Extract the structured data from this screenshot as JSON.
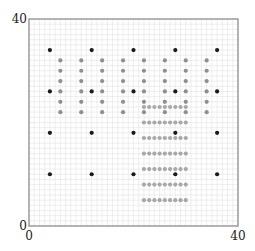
{
  "chart_data": {
    "type": "scatter",
    "title": "",
    "xlabel": "",
    "ylabel": "",
    "xlim": [
      0,
      40
    ],
    "ylim": [
      0,
      40
    ],
    "grid": true,
    "grid_step": 1,
    "ticks": {
      "x": [
        {
          "value": 0,
          "label": "0"
        },
        {
          "value": 40,
          "label": "40"
        }
      ],
      "y": [
        {
          "value": 0,
          "label": "0"
        },
        {
          "value": 40,
          "label": "40"
        }
      ]
    },
    "series": [
      {
        "name": "coarse-black",
        "color": "#1a1a1a",
        "grid": {
          "x": [
            4,
            12,
            20,
            28,
            36
          ],
          "y": [
            34,
            26,
            18,
            10
          ]
        }
      },
      {
        "name": "medium-gray",
        "color": "#8f8f8f",
        "grid": {
          "x": [
            6,
            10,
            14,
            18,
            22,
            26,
            30,
            34
          ],
          "y": [
            32,
            30,
            28,
            26,
            24,
            22
          ]
        }
      },
      {
        "name": "fine-gray",
        "color": "#a8a8a8",
        "grid": {
          "x": [
            22,
            23,
            24,
            25,
            26,
            27,
            28,
            29,
            30
          ],
          "y": [
            23,
            20,
            17,
            14,
            11,
            8,
            5
          ]
        }
      }
    ],
    "legend": null
  },
  "colors": {
    "grid_line": "#e3e3e3",
    "axis_line": "#888888",
    "background": "#ffffff"
  },
  "layout": {
    "plot_left": 29,
    "plot_top": 19,
    "plot_right": 238,
    "plot_bottom": 226
  }
}
